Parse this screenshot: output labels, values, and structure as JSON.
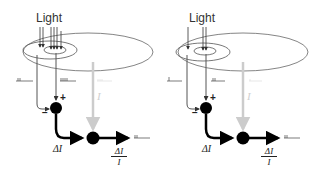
{
  "diagram": {
    "type": "receptive-field-contrast-normalization",
    "panels": [
      {
        "id": "left",
        "light_label": "Light",
        "light_arrow_count_surround": 2,
        "light_arrow_count_center": 4,
        "plus_label": "+",
        "minus_label": "−",
        "delta_label": "ΔI",
        "mean_label": "I",
        "output_num": "ΔI",
        "output_den": "I"
      },
      {
        "id": "right",
        "light_label": "Light",
        "light_arrow_count_surround": 1,
        "light_arrow_count_center": 2,
        "plus_label": "+",
        "minus_label": "−",
        "delta_label": "ΔI",
        "mean_label": "I",
        "output_num": "ΔI",
        "output_den": "I"
      }
    ],
    "colors": {
      "line": "#333333",
      "thick_line": "#000000",
      "gray_path": "#cccccc",
      "ellipse": "#555555"
    }
  }
}
